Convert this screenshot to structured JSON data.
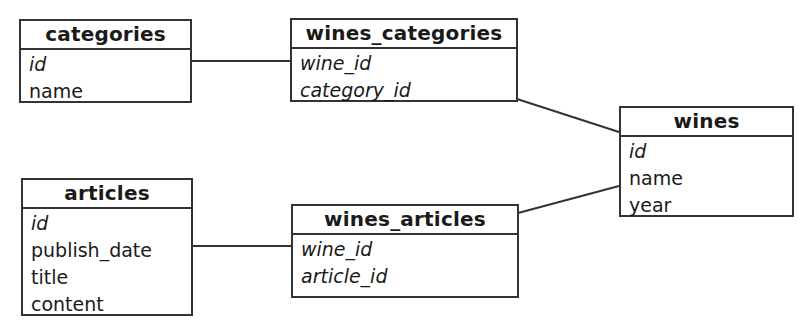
{
  "diagram": {
    "type": "entity-relationship",
    "entities": {
      "categories": {
        "title": "categories",
        "fields": [
          {
            "name": "id",
            "key": true
          },
          {
            "name": "name",
            "key": false
          }
        ]
      },
      "wines_categories": {
        "title": "wines_categories",
        "fields": [
          {
            "name": "wine_id",
            "key": true
          },
          {
            "name": "category_id",
            "key": true
          }
        ]
      },
      "wines": {
        "title": "wines",
        "fields": [
          {
            "name": "id",
            "key": true
          },
          {
            "name": "name",
            "key": false
          },
          {
            "name": "year",
            "key": false
          }
        ]
      },
      "articles": {
        "title": "articles",
        "fields": [
          {
            "name": "id",
            "key": true
          },
          {
            "name": "publish_date",
            "key": false
          },
          {
            "name": "title",
            "key": false
          },
          {
            "name": "content",
            "key": false
          }
        ]
      },
      "wines_articles": {
        "title": "wines_articles",
        "fields": [
          {
            "name": "wine_id",
            "key": true
          },
          {
            "name": "article_id",
            "key": true
          }
        ]
      }
    },
    "relationships": [
      {
        "from": "categories",
        "to": "wines_categories"
      },
      {
        "from": "wines_categories",
        "to": "wines"
      },
      {
        "from": "articles",
        "to": "wines_articles"
      },
      {
        "from": "wines_articles",
        "to": "wines"
      }
    ],
    "colors": {
      "line": "#333333",
      "background": "#ffffff",
      "text": "#1a1a1a"
    }
  }
}
